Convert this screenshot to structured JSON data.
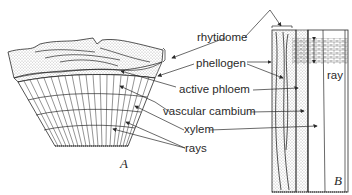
{
  "diagram": {
    "panels": [
      {
        "id": "A",
        "label": "A"
      },
      {
        "id": "B",
        "label": "B"
      }
    ],
    "labels": {
      "rhytidome": "rhytidome",
      "phellogen": "phellogen",
      "active_phloem": "active phloem",
      "vascular_cambium": "vascular cambium",
      "xylem": "xylem",
      "rays": "rays",
      "ray": "ray"
    },
    "colors": {
      "line": "#2a2a2a",
      "background": "#ffffff"
    }
  }
}
